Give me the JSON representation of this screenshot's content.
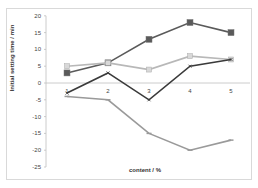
{
  "chart_data": {
    "type": "line",
    "title": "",
    "xlabel": "content / %",
    "ylabel": "Initial setting time / min",
    "categories": [
      "1",
      "2",
      "3",
      "4",
      "5"
    ],
    "ylim": [
      -25,
      20
    ],
    "yticks": [
      20,
      15,
      10,
      5,
      0,
      -5,
      -10,
      -15,
      -20,
      -25
    ],
    "grid": false,
    "legend": "none",
    "series": [
      {
        "name": "series-1",
        "color": "#5a5a5a",
        "marker": "square",
        "values": [
          3,
          6,
          13,
          18,
          15
        ]
      },
      {
        "name": "series-2",
        "color": "#b8b8b8",
        "marker": "square-light",
        "values": [
          5,
          6,
          4,
          8,
          7
        ]
      },
      {
        "name": "series-3",
        "color": "#3a3a3a",
        "marker": "x",
        "values": [
          -3,
          3,
          -5,
          5,
          7
        ]
      },
      {
        "name": "series-4",
        "color": "#9a9a9a",
        "marker": "dash",
        "values": [
          -4,
          -5,
          -15,
          -20,
          -17
        ]
      }
    ]
  }
}
